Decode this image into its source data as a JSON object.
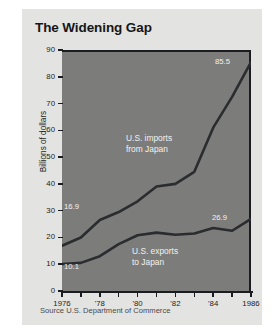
{
  "figure": {
    "title": "The Widening Gap",
    "source": "Source  U.S. Department of Commerce",
    "ylabel": "Billions of dollars",
    "background_color": "#e3e3e1",
    "plot_background_color": "#7c7c7a",
    "line_color": "#2b2c30"
  },
  "chart_data": {
    "type": "line",
    "title": "The Widening Gap",
    "xlabel": "",
    "ylabel": "Billions of dollars",
    "xlim": [
      1976,
      1986
    ],
    "ylim": [
      0,
      90
    ],
    "grid": false,
    "legend": "inline-annotations",
    "x": [
      1976,
      1977,
      1978,
      1979,
      1980,
      1981,
      1982,
      1983,
      1984,
      1985,
      1986
    ],
    "xtick_labels": [
      "1976",
      "'78",
      "'80",
      "'82",
      "'84",
      "1986"
    ],
    "xtick_values": [
      1976,
      1978,
      1980,
      1982,
      1984,
      1986
    ],
    "ytick_labels": [
      "0",
      "10",
      "20",
      "30",
      "40",
      "50",
      "60",
      "70",
      "80",
      "90"
    ],
    "ytick_values": [
      0,
      10,
      20,
      30,
      40,
      50,
      60,
      70,
      80,
      90
    ],
    "series": [
      {
        "name": "U.S. imports from Japan",
        "label_line1": "U.S. imports",
        "label_line2": "from Japan",
        "values": [
          16.9,
          20.0,
          26.5,
          29.5,
          33.5,
          39.0,
          40.0,
          44.5,
          61.0,
          72.5,
          85.5
        ],
        "start_label": "16.9",
        "end_label": "85.5"
      },
      {
        "name": "U.S. exports to Japan",
        "label_line1": "U.S. exports",
        "label_line2": "to Japan",
        "values": [
          10.1,
          10.5,
          13.0,
          17.5,
          20.8,
          21.8,
          21.0,
          21.5,
          23.5,
          22.5,
          26.9
        ],
        "start_label": "10.1",
        "end_label": "26.9"
      }
    ]
  },
  "ytick_labels": {
    "t0": "0",
    "t1": "10",
    "t2": "20",
    "t3": "30",
    "t4": "40",
    "t5": "50",
    "t6": "60",
    "t7": "70",
    "t8": "80",
    "t9": "90"
  },
  "xtick_labels": {
    "t0": "1976",
    "t1": "'78",
    "t2": "'80",
    "t3": "'82",
    "t4": "'84",
    "t5": "1986"
  }
}
